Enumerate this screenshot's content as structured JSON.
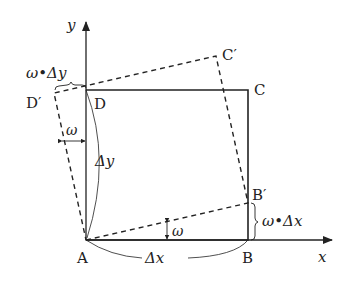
{
  "diagram": {
    "axes": {
      "x_label": "x",
      "y_label": "y"
    },
    "points": {
      "A": "A",
      "B": "B",
      "C": "C",
      "D": "D",
      "B_prime": "B′",
      "C_prime": "C′",
      "D_prime": "D′"
    },
    "annotations": {
      "delta_x": "Δx",
      "delta_y": "Δy",
      "omega_bottom": "ω",
      "omega_left": "ω",
      "omega_delta_x": "ω•Δx",
      "omega_delta_y": "ω•Δy"
    },
    "colors": {
      "line": "#222222",
      "background": "#ffffff"
    }
  }
}
